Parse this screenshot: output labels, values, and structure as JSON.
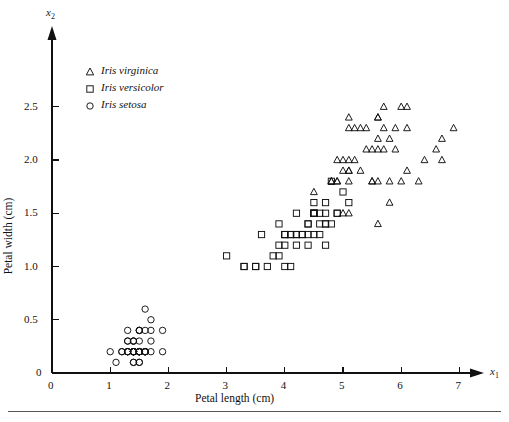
{
  "figure": {
    "background": "#ffffff",
    "ink": "#111111",
    "has_bottom_rule": true
  },
  "axes": {
    "x_variable_label": "x",
    "x_variable_sub": "1",
    "y_variable_label": "x",
    "y_variable_sub": "2",
    "x_title": "Petal length (cm)",
    "y_title": "Petal width (cm)",
    "x_ticks": [
      "0",
      "1",
      "2",
      "3",
      "4",
      "5",
      "6",
      "7"
    ],
    "y_ticks": [
      "0",
      "0.5",
      "1.0",
      "1.5",
      "2.0",
      "2.5"
    ],
    "x_origin_label": "0",
    "arrowheads": true
  },
  "legend": {
    "items": [
      {
        "marker": "triangle",
        "label": "Iris virginica"
      },
      {
        "marker": "square",
        "label": "Iris versicolor"
      },
      {
        "marker": "circle",
        "label": "Iris setosa"
      }
    ]
  },
  "chart_data": {
    "type": "scatter",
    "title": "",
    "xlabel": "Petal length (cm)",
    "ylabel": "Petal width (cm)",
    "xlim": [
      0,
      7.4
    ],
    "ylim": [
      0,
      2.75
    ],
    "xticks": [
      0,
      1,
      2,
      3,
      4,
      5,
      6,
      7
    ],
    "yticks": [
      0,
      0.5,
      1.0,
      1.5,
      2.0,
      2.5
    ],
    "grid": false,
    "legend_position": "upper-left-inside",
    "marker_fill": "none",
    "marker_stroke": "#111111",
    "series": [
      {
        "name": "Iris setosa",
        "marker": "circle",
        "points": [
          [
            1.4,
            0.2
          ],
          [
            1.4,
            0.2
          ],
          [
            1.3,
            0.2
          ],
          [
            1.5,
            0.2
          ],
          [
            1.4,
            0.2
          ],
          [
            1.7,
            0.4
          ],
          [
            1.4,
            0.3
          ],
          [
            1.5,
            0.2
          ],
          [
            1.4,
            0.2
          ],
          [
            1.5,
            0.1
          ],
          [
            1.5,
            0.2
          ],
          [
            1.6,
            0.2
          ],
          [
            1.4,
            0.1
          ],
          [
            1.1,
            0.1
          ],
          [
            1.2,
            0.2
          ],
          [
            1.5,
            0.4
          ],
          [
            1.3,
            0.4
          ],
          [
            1.4,
            0.3
          ],
          [
            1.7,
            0.3
          ],
          [
            1.5,
            0.3
          ],
          [
            1.7,
            0.2
          ],
          [
            1.5,
            0.4
          ],
          [
            1.0,
            0.2
          ],
          [
            1.7,
            0.5
          ],
          [
            1.9,
            0.2
          ],
          [
            1.6,
            0.2
          ],
          [
            1.6,
            0.4
          ],
          [
            1.5,
            0.2
          ],
          [
            1.4,
            0.2
          ],
          [
            1.6,
            0.2
          ],
          [
            1.6,
            0.2
          ],
          [
            1.5,
            0.4
          ],
          [
            1.5,
            0.1
          ],
          [
            1.4,
            0.2
          ],
          [
            1.5,
            0.2
          ],
          [
            1.2,
            0.2
          ],
          [
            1.3,
            0.2
          ],
          [
            1.4,
            0.1
          ],
          [
            1.3,
            0.2
          ],
          [
            1.5,
            0.2
          ],
          [
            1.3,
            0.3
          ],
          [
            1.3,
            0.3
          ],
          [
            1.3,
            0.2
          ],
          [
            1.6,
            0.6
          ],
          [
            1.9,
            0.4
          ],
          [
            1.4,
            0.3
          ],
          [
            1.6,
            0.2
          ],
          [
            1.4,
            0.2
          ],
          [
            1.5,
            0.2
          ],
          [
            1.4,
            0.2
          ]
        ]
      },
      {
        "name": "Iris versicolor",
        "marker": "square",
        "points": [
          [
            4.7,
            1.4
          ],
          [
            4.5,
            1.5
          ],
          [
            4.9,
            1.5
          ],
          [
            4.0,
            1.3
          ],
          [
            4.6,
            1.5
          ],
          [
            4.5,
            1.3
          ],
          [
            4.7,
            1.6
          ],
          [
            3.3,
            1.0
          ],
          [
            4.6,
            1.3
          ],
          [
            3.9,
            1.4
          ],
          [
            3.5,
            1.0
          ],
          [
            4.2,
            1.5
          ],
          [
            4.0,
            1.0
          ],
          [
            4.7,
            1.4
          ],
          [
            3.6,
            1.3
          ],
          [
            4.4,
            1.4
          ],
          [
            4.5,
            1.5
          ],
          [
            4.1,
            1.0
          ],
          [
            4.5,
            1.5
          ],
          [
            3.9,
            1.1
          ],
          [
            4.8,
            1.8
          ],
          [
            4.0,
            1.3
          ],
          [
            4.9,
            1.5
          ],
          [
            4.7,
            1.2
          ],
          [
            4.3,
            1.3
          ],
          [
            4.4,
            1.4
          ],
          [
            4.8,
            1.4
          ],
          [
            5.0,
            1.7
          ],
          [
            4.5,
            1.5
          ],
          [
            3.5,
            1.0
          ],
          [
            3.8,
            1.1
          ],
          [
            3.7,
            1.0
          ],
          [
            3.9,
            1.2
          ],
          [
            5.1,
            1.6
          ],
          [
            4.5,
            1.5
          ],
          [
            4.5,
            1.6
          ],
          [
            4.7,
            1.5
          ],
          [
            4.4,
            1.3
          ],
          [
            4.1,
            1.3
          ],
          [
            4.0,
            1.3
          ],
          [
            4.4,
            1.2
          ],
          [
            4.6,
            1.4
          ],
          [
            4.0,
            1.2
          ],
          [
            3.3,
            1.0
          ],
          [
            4.2,
            1.3
          ],
          [
            4.2,
            1.2
          ],
          [
            4.2,
            1.3
          ],
          [
            4.3,
            1.3
          ],
          [
            3.0,
            1.1
          ],
          [
            4.1,
            1.3
          ]
        ]
      },
      {
        "name": "Iris virginica",
        "marker": "triangle",
        "points": [
          [
            6.0,
            2.5
          ],
          [
            5.1,
            1.9
          ],
          [
            5.9,
            2.1
          ],
          [
            5.6,
            1.8
          ],
          [
            5.8,
            2.2
          ],
          [
            6.6,
            2.1
          ],
          [
            4.5,
            1.7
          ],
          [
            6.3,
            1.8
          ],
          [
            5.8,
            1.8
          ],
          [
            6.1,
            2.5
          ],
          [
            5.1,
            2.0
          ],
          [
            5.3,
            1.9
          ],
          [
            5.5,
            2.1
          ],
          [
            5.0,
            2.0
          ],
          [
            5.1,
            2.4
          ],
          [
            5.3,
            2.3
          ],
          [
            5.5,
            1.8
          ],
          [
            6.7,
            2.2
          ],
          [
            6.9,
            2.3
          ],
          [
            5.0,
            1.5
          ],
          [
            5.7,
            2.3
          ],
          [
            4.9,
            2.0
          ],
          [
            6.7,
            2.0
          ],
          [
            4.9,
            1.8
          ],
          [
            5.7,
            2.1
          ],
          [
            6.0,
            1.8
          ],
          [
            4.8,
            1.8
          ],
          [
            4.9,
            1.8
          ],
          [
            5.6,
            2.1
          ],
          [
            5.8,
            1.6
          ],
          [
            6.1,
            1.9
          ],
          [
            6.4,
            2.0
          ],
          [
            5.6,
            2.2
          ],
          [
            5.1,
            1.5
          ],
          [
            5.6,
            1.4
          ],
          [
            6.1,
            2.3
          ],
          [
            5.6,
            2.4
          ],
          [
            5.5,
            1.8
          ],
          [
            4.8,
            1.8
          ],
          [
            5.4,
            2.1
          ],
          [
            5.6,
            2.4
          ],
          [
            5.1,
            2.3
          ],
          [
            5.1,
            1.9
          ],
          [
            5.9,
            2.3
          ],
          [
            5.7,
            2.5
          ],
          [
            5.2,
            2.3
          ],
          [
            5.0,
            1.9
          ],
          [
            5.2,
            2.0
          ],
          [
            5.4,
            2.3
          ],
          [
            5.1,
            1.8
          ]
        ]
      }
    ]
  }
}
